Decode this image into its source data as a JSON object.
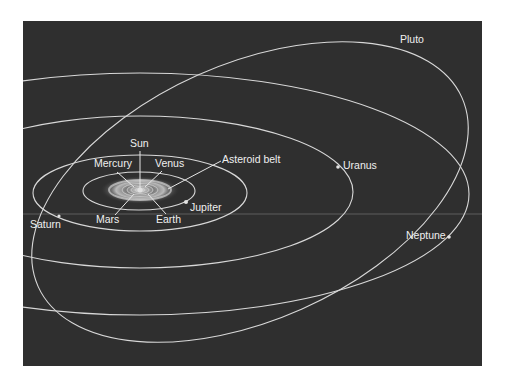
{
  "diagram": {
    "title": "",
    "background": "#2f2f2f",
    "orbit_color": "#d8d8d8",
    "labels": {
      "sun": "Sun",
      "mercury": "Mercury",
      "venus": "Venus",
      "asteroid_belt": "Asteroid belt",
      "mars": "Mars",
      "earth": "Earth",
      "jupiter": "Jupiter",
      "saturn": "Saturn",
      "uranus": "Uranus",
      "neptune": "Neptune",
      "pluto": "Pluto"
    },
    "bodies": [
      {
        "name": "Sun",
        "x": 140,
        "y": 190
      },
      {
        "name": "Jupiter",
        "x": 186,
        "y": 202
      },
      {
        "name": "Saturn",
        "x": 59,
        "y": 216
      },
      {
        "name": "Uranus",
        "x": 338,
        "y": 167
      },
      {
        "name": "Neptune",
        "x": 449,
        "y": 237
      }
    ],
    "orbits": [
      {
        "name": "Jupiter",
        "cx": 139,
        "cy": 191,
        "rx": 56,
        "ry": 19
      },
      {
        "name": "Saturn",
        "cx": 140,
        "cy": 193,
        "rx": 107,
        "ry": 38
      },
      {
        "name": "Uranus",
        "cx": 140,
        "cy": 192,
        "rx": 213,
        "ry": 76
      },
      {
        "name": "Neptune",
        "cx": 140,
        "cy": 194,
        "rx": 329,
        "ry": 121
      },
      {
        "name": "Pluto",
        "cx": 250,
        "cy": 192,
        "rx": 232,
        "ry": 128,
        "rotation": -24
      }
    ]
  }
}
